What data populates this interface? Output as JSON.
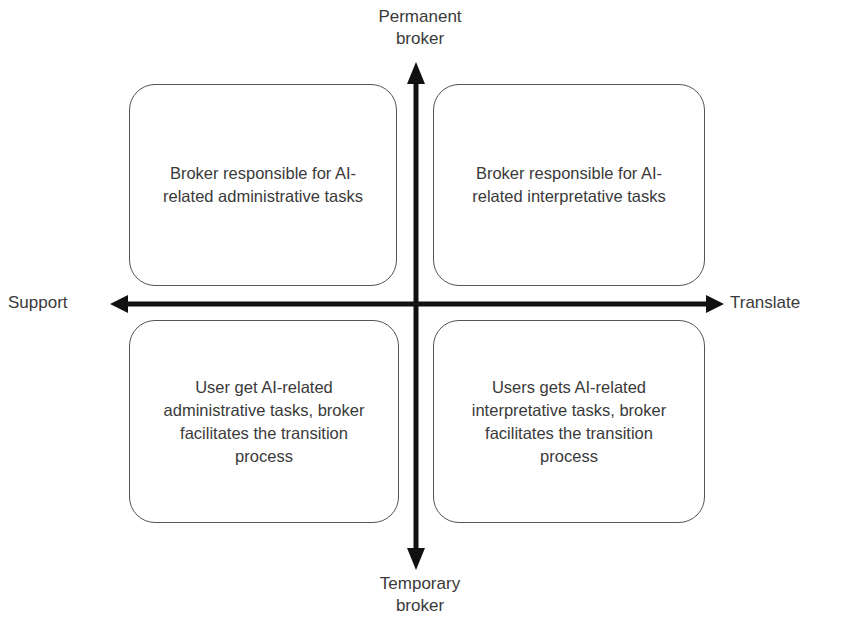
{
  "axes": {
    "top": {
      "line1": "Permanent",
      "line2": "broker"
    },
    "bottom": {
      "line1": "Temporary",
      "line2": "broker"
    },
    "left": "Support",
    "right": "Translate"
  },
  "quadrants": {
    "top_left": "Broker responsible for AI-related administrative tasks",
    "top_right": "Broker responsible for AI-related interpretative tasks",
    "bottom_left": "User get AI-related administrative tasks, broker facilitates the transition process",
    "bottom_right": "Users gets AI-related interpretative tasks, broker facilitates the transition process"
  },
  "colors": {
    "axis": "#111111",
    "box_border": "#555555",
    "text": "#3a3a3a"
  }
}
